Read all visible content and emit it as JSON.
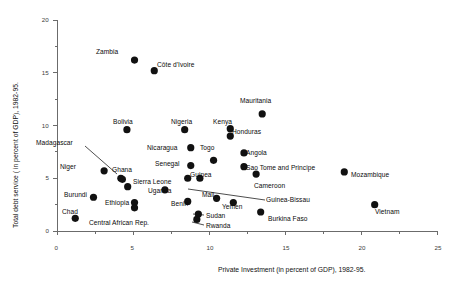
{
  "chart_data": {
    "type": "scatter",
    "title": "",
    "xlabel": "Private Investment  (in percent of GDP), 1982-95.",
    "ylabel": "Total debt service  ( in percent of GDP), 1982-95.",
    "xlim": [
      0,
      25
    ],
    "ylim": [
      0,
      20
    ],
    "xticks": [
      "0",
      "5",
      "10",
      "15",
      "20",
      "25"
    ],
    "yticks": [
      "0",
      "5",
      "10",
      "15",
      "20"
    ],
    "grid": false,
    "legend": "none",
    "marker_color": "#111111",
    "axis_color": "#6b6b6b",
    "points": [
      {
        "label": "Zambia",
        "x": 5.1,
        "y": 16.2,
        "lx": 96,
        "ly": 48,
        "leader": null
      },
      {
        "label": "Côte d'Ivoire",
        "x": 6.4,
        "y": 15.2,
        "lx": 157,
        "ly": 61,
        "leader": null
      },
      {
        "label": "Mauritania",
        "x": 13.5,
        "y": 11.1,
        "lx": 240,
        "ly": 97,
        "leader": null
      },
      {
        "label": "Bolivia",
        "x": 4.6,
        "y": 9.6,
        "lx": 113,
        "ly": 118,
        "leader": null
      },
      {
        "label": "Nigeria",
        "x": 8.4,
        "y": 9.6,
        "lx": 171,
        "ly": 118,
        "leader": null
      },
      {
        "label": "Kenya",
        "x": 11.4,
        "y": 9.7,
        "lx": 213,
        "ly": 118,
        "leader": null
      },
      {
        "label": "Honduras",
        "x": 11.4,
        "y": 9.0,
        "lx": 232,
        "ly": 128,
        "leader": null
      },
      {
        "label": "Nicaragua",
        "x": 8.8,
        "y": 7.9,
        "lx": 147,
        "ly": 144,
        "leader": null
      },
      {
        "label": "Togo",
        "x": 10.3,
        "y": 6.7,
        "lx": 200,
        "ly": 144,
        "leader": null
      },
      {
        "label": "Angola",
        "x": 12.3,
        "y": 7.4,
        "lx": 246,
        "ly": 149,
        "leader": null
      },
      {
        "label": "Madagascar",
        "x": 4.2,
        "y": 5.0,
        "lx": 36,
        "ly": 139,
        "leader": [
          85,
          146,
          117,
          174
        ]
      },
      {
        "label": "Niger",
        "x": 3.1,
        "y": 5.7,
        "lx": 60,
        "ly": 163,
        "leader": null
      },
      {
        "label": "Senegal",
        "x": 8.8,
        "y": 6.2,
        "lx": 155,
        "ly": 160,
        "leader": null
      },
      {
        "label": "Sao Tome and Principe",
        "x": 12.3,
        "y": 6.1,
        "lx": 246,
        "ly": 164,
        "leader": null
      },
      {
        "label": "Mozambique",
        "x": 18.9,
        "y": 5.6,
        "lx": 351,
        "ly": 171,
        "leader": null
      },
      {
        "label": "Ghana",
        "x": 4.3,
        "y": 4.9,
        "lx": 112,
        "ly": 166,
        "leader": null
      },
      {
        "label": "Guinea",
        "x": 9.4,
        "y": 5.0,
        "lx": 190,
        "ly": 171,
        "leader": null
      },
      {
        "label": "Sierra Leone",
        "x": 4.65,
        "y": 4.2,
        "lx": 133,
        "ly": 178,
        "leader": null
      },
      {
        "label": "Cameroon",
        "x": 13.1,
        "y": 5.4,
        "lx": 254,
        "ly": 182,
        "leader": null
      },
      {
        "label": "Uganda",
        "x": 7.1,
        "y": 3.9,
        "lx": 148,
        "ly": 187,
        "leader": null
      },
      {
        "label": "Guinea-Bissau",
        "x": 8.6,
        "y": 5.0,
        "lx": 266,
        "ly": 196,
        "leader": [
          265,
          200,
          188,
          189
        ]
      },
      {
        "label": "Burundi",
        "x": 2.4,
        "y": 3.2,
        "lx": 64,
        "ly": 191,
        "leader": null
      },
      {
        "label": "Mali",
        "x": 10.5,
        "y": 3.1,
        "lx": 202,
        "ly": 191,
        "leader": null
      },
      {
        "label": "Benin",
        "x": 8.6,
        "y": 2.8,
        "lx": 171,
        "ly": 200,
        "leader": null
      },
      {
        "label": "Ethiopia",
        "x": 5.1,
        "y": 2.7,
        "lx": 105,
        "ly": 199,
        "leader": null
      },
      {
        "label": "Yemen",
        "x": 11.6,
        "y": 2.7,
        "lx": 222,
        "ly": 203,
        "leader": null
      },
      {
        "label": "Vietnam",
        "x": 20.9,
        "y": 2.5,
        "lx": 375,
        "ly": 208,
        "leader": null
      },
      {
        "label": "Chad",
        "x": 1.2,
        "y": 1.2,
        "lx": 62,
        "ly": 208,
        "leader": null
      },
      {
        "label": "Central African Rep.",
        "x": 5.1,
        "y": 2.2,
        "lx": 89,
        "ly": 219,
        "leader": null
      },
      {
        "label": "Sudan",
        "x": 9.3,
        "y": 1.6,
        "lx": 206,
        "ly": 212,
        "leader": [
          204,
          215,
          193,
          214
        ]
      },
      {
        "label": "Burkina Faso",
        "x": 13.4,
        "y": 1.8,
        "lx": 268,
        "ly": 215,
        "leader": null
      },
      {
        "label": "Rwanda",
        "x": 9.2,
        "y": 1.1,
        "lx": 206,
        "ly": 222,
        "leader": [
          204,
          225,
          192,
          222
        ]
      }
    ]
  }
}
